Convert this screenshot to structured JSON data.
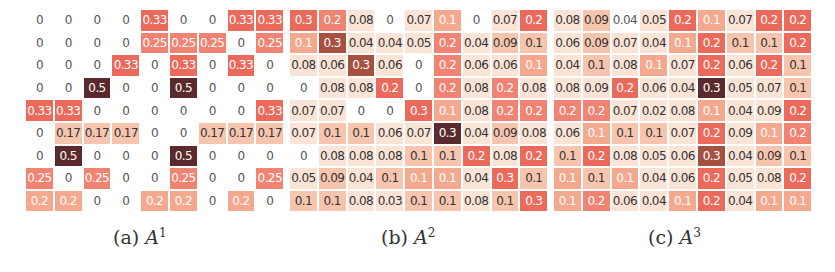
{
  "figure": {
    "panels": [
      {
        "id": "a",
        "caption_prefix": "(a)",
        "caption_symbol": "A",
        "caption_superscript": "1",
        "values": [
          [
            "0",
            "0",
            "0",
            "0",
            "0.33",
            "0",
            "0",
            "0.33",
            "0.33"
          ],
          [
            "0",
            "0",
            "0",
            "0",
            "0.25",
            "0.25",
            "0.25",
            "0",
            "0.25"
          ],
          [
            "0",
            "0",
            "0",
            "0.33",
            "0",
            "0.33",
            "0",
            "0.33",
            "0"
          ],
          [
            "0",
            "0",
            "0.5",
            "0",
            "0",
            "0.5",
            "0",
            "0",
            "0"
          ],
          [
            "0.33",
            "0.33",
            "0",
            "0",
            "0",
            "0",
            "0",
            "0",
            "0.33"
          ],
          [
            "0",
            "0.17",
            "0.17",
            "0.17",
            "0",
            "0",
            "0.17",
            "0.17",
            "0.17"
          ],
          [
            "0",
            "0.5",
            "0",
            "0",
            "0",
            "0.5",
            "0",
            "0",
            "0"
          ],
          [
            "0.25",
            "0",
            "0.25",
            "0",
            "0",
            "0.25",
            "0",
            "0",
            "0.25"
          ],
          [
            "0.2",
            "0.2",
            "0",
            "0",
            "0.2",
            "0.2",
            "0",
            "0.2",
            "0"
          ]
        ],
        "shade_classes": [
          [
            0,
            0,
            0,
            0,
            5,
            0,
            0,
            5,
            5
          ],
          [
            0,
            0,
            0,
            0,
            4,
            4,
            4,
            0,
            4
          ],
          [
            0,
            0,
            0,
            5,
            0,
            5,
            0,
            5,
            0
          ],
          [
            0,
            0,
            7,
            0,
            0,
            7,
            0,
            0,
            0
          ],
          [
            5,
            5,
            0,
            0,
            0,
            0,
            0,
            0,
            5
          ],
          [
            0,
            2,
            2,
            2,
            0,
            0,
            2,
            2,
            2
          ],
          [
            0,
            7,
            0,
            0,
            0,
            7,
            0,
            0,
            0
          ],
          [
            4,
            0,
            4,
            0,
            0,
            4,
            0,
            0,
            4
          ],
          [
            3,
            3,
            0,
            0,
            3,
            3,
            0,
            3,
            0
          ]
        ]
      },
      {
        "id": "b",
        "caption_prefix": "(b)",
        "caption_symbol": "A",
        "caption_superscript": "2",
        "values": [
          [
            "0.3",
            "0.2",
            "0.08",
            "0",
            "0.07",
            "0.1",
            "0",
            "0.07",
            "0.2"
          ],
          [
            "0.1",
            "0.3",
            "0.04",
            "0.04",
            "0.05",
            "0.2",
            "0.04",
            "0.09",
            "0.1"
          ],
          [
            "0.08",
            "0.06",
            "0.3",
            "0.06",
            "0",
            "0.2",
            "0.06",
            "0.06",
            "0.1"
          ],
          [
            "0",
            "0.08",
            "0.08",
            "0.2",
            "0",
            "0.2",
            "0.08",
            "0.2",
            "0.08"
          ],
          [
            "0.07",
            "0.07",
            "0",
            "0",
            "0.3",
            "0.1",
            "0.08",
            "0.2",
            "0.2"
          ],
          [
            "0.07",
            "0.1",
            "0.1",
            "0.06",
            "0.07",
            "0.3",
            "0.04",
            "0.09",
            "0.08"
          ],
          [
            "0",
            "0.08",
            "0.08",
            "0.08",
            "0.1",
            "0.1",
            "0.2",
            "0.08",
            "0.2"
          ],
          [
            "0.05",
            "0.09",
            "0.04",
            "0.1",
            "0.1",
            "0.1",
            "0.04",
            "0.3",
            "0.1"
          ],
          [
            "0.1",
            "0.1",
            "0.08",
            "0.03",
            "0.1",
            "0.1",
            "0.08",
            "0.1",
            "0.3"
          ]
        ],
        "shade_classes": [
          [
            5,
            4,
            1,
            0,
            1,
            3,
            0,
            1,
            5
          ],
          [
            3,
            6,
            1,
            1,
            1,
            4,
            1,
            2,
            2
          ],
          [
            1,
            1,
            6,
            1,
            0,
            4,
            1,
            1,
            3
          ],
          [
            0,
            1,
            1,
            5,
            0,
            4,
            1,
            4,
            1
          ],
          [
            1,
            1,
            0,
            0,
            5,
            3,
            1,
            4,
            4
          ],
          [
            1,
            2,
            2,
            1,
            1,
            7,
            1,
            2,
            1
          ],
          [
            0,
            1,
            1,
            1,
            2,
            2,
            5,
            1,
            5
          ],
          [
            1,
            2,
            1,
            2,
            3,
            3,
            1,
            5,
            2
          ],
          [
            2,
            2,
            1,
            1,
            2,
            2,
            1,
            2,
            5
          ]
        ]
      },
      {
        "id": "c",
        "caption_prefix": "(c)",
        "caption_symbol": "A",
        "caption_superscript": "3",
        "values": [
          [
            "0.08",
            "0.09",
            "0.04",
            "0.05",
            "0.2",
            "0.1",
            "0.07",
            "0.2",
            "0.2"
          ],
          [
            "0.06",
            "0.09",
            "0.07",
            "0.04",
            "0.1",
            "0.2",
            "0.1",
            "0.1",
            "0.2"
          ],
          [
            "0.04",
            "0.1",
            "0.08",
            "0.1",
            "0.07",
            "0.2",
            "0.06",
            "0.2",
            "0.1"
          ],
          [
            "0.08",
            "0.09",
            "0.2",
            "0.06",
            "0.04",
            "0.3",
            "0.05",
            "0.07",
            "0.1"
          ],
          [
            "0.2",
            "0.2",
            "0.07",
            "0.02",
            "0.08",
            "0.1",
            "0.04",
            "0.09",
            "0.2"
          ],
          [
            "0.06",
            "0.1",
            "0.1",
            "0.1",
            "0.07",
            "0.2",
            "0.09",
            "0.1",
            "0.2"
          ],
          [
            "0.1",
            "0.2",
            "0.08",
            "0.05",
            "0.06",
            "0.3",
            "0.04",
            "0.09",
            "0.1"
          ],
          [
            "0.1",
            "0.1",
            "0.1",
            "0.04",
            "0.06",
            "0.2",
            "0.05",
            "0.08",
            "0.2"
          ],
          [
            "0.1",
            "0.2",
            "0.06",
            "0.04",
            "0.1",
            "0.2",
            "0.04",
            "0.1",
            "0.1"
          ]
        ],
        "shade_classes": [
          [
            1,
            2,
            0,
            1,
            5,
            3,
            1,
            5,
            5
          ],
          [
            1,
            2,
            1,
            1,
            3,
            5,
            2,
            2,
            5
          ],
          [
            1,
            2,
            1,
            3,
            1,
            5,
            1,
            5,
            2
          ],
          [
            1,
            1,
            5,
            1,
            1,
            7,
            1,
            1,
            2
          ],
          [
            4,
            4,
            1,
            1,
            1,
            3,
            1,
            1,
            5
          ],
          [
            1,
            3,
            2,
            2,
            1,
            5,
            1,
            3,
            4
          ],
          [
            2,
            5,
            1,
            1,
            1,
            6,
            1,
            2,
            2
          ],
          [
            3,
            2,
            3,
            1,
            1,
            5,
            1,
            1,
            5
          ],
          [
            3,
            4,
            1,
            1,
            3,
            5,
            1,
            3,
            3
          ]
        ]
      }
    ],
    "color_scale": {
      "0": "#ffffff",
      "1": "#fbe3d6",
      "2": "#f7c5ae",
      "3": "#f4a88e",
      "4": "#f08372",
      "5": "#ec6a5c",
      "6": "#a8503f",
      "7": "#5a2a2c"
    }
  }
}
